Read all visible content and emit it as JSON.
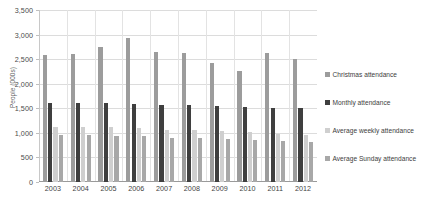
{
  "chart_data": {
    "type": "bar",
    "title": "",
    "xlabel": "",
    "ylabel": "People (000s)",
    "ylim": [
      0,
      3500
    ],
    "ytick_step": 500,
    "grid": true,
    "legend_position": "right",
    "categories": [
      "2003",
      "2004",
      "2005",
      "2006",
      "2007",
      "2008",
      "2009",
      "2010",
      "2011",
      "2012"
    ],
    "series": [
      {
        "name": "Christmas attendance",
        "color": "#9c9c9c",
        "values": [
          2580,
          2600,
          2740,
          2930,
          2650,
          2620,
          2420,
          2260,
          2620,
          2500
        ]
      },
      {
        "name": "Monthly attendance",
        "color": "#3f3f3f",
        "values": [
          1610,
          1600,
          1610,
          1590,
          1570,
          1560,
          1540,
          1520,
          1510,
          1500
        ]
      },
      {
        "name": "Average weekly attendance",
        "color": "#cfcfcf",
        "values": [
          1120,
          1110,
          1120,
          1100,
          1060,
          1050,
          1030,
          1010,
          970,
          950
        ]
      },
      {
        "name": "Average Sunday attendance",
        "color": "#a8a8a8",
        "values": [
          965,
          950,
          940,
          930,
          900,
          890,
          870,
          850,
          830,
          810
        ]
      }
    ]
  },
  "axes": {
    "y_ticks": [
      "3,500",
      "3,000",
      "2,500",
      "2,000",
      "1,500",
      "1,000",
      "500",
      "0"
    ],
    "y_title": "People (000s)",
    "x_ticks": [
      "2003",
      "2004",
      "2005",
      "2006",
      "2007",
      "2008",
      "2009",
      "2010",
      "2011",
      "2012"
    ]
  },
  "legend": {
    "items": [
      {
        "label": "Christmas attendance",
        "color": "#9c9c9c"
      },
      {
        "label": "Monthly attendance",
        "color": "#3f3f3f"
      },
      {
        "label": "Average weekly attendance",
        "color": "#cfcfcf"
      },
      {
        "label": "Average Sunday attendance",
        "color": "#a8a8a8"
      }
    ]
  }
}
